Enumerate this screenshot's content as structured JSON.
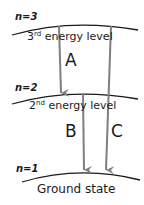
{
  "levels": [
    {
      "n_label": "n=3",
      "ordinal_num": "3",
      "ordinal_suffix": "rd",
      "name": "energy level"
    },
    {
      "n_label": "n=2",
      "ordinal_num": "2",
      "ordinal_suffix": "nd",
      "name": "energy level"
    },
    {
      "n_label": "n=1",
      "name": "Ground state"
    }
  ],
  "transitions": [
    {
      "label": "A",
      "from": "n=3",
      "to": "n=2"
    },
    {
      "label": "B",
      "from": "n=2",
      "to": "n=1"
    },
    {
      "label": "C",
      "from": "n=3",
      "to": "n=1"
    }
  ],
  "colors": {
    "curve": "#1a1a1a",
    "arrow": "#7f7f7f",
    "text": "#1a1a1a"
  }
}
